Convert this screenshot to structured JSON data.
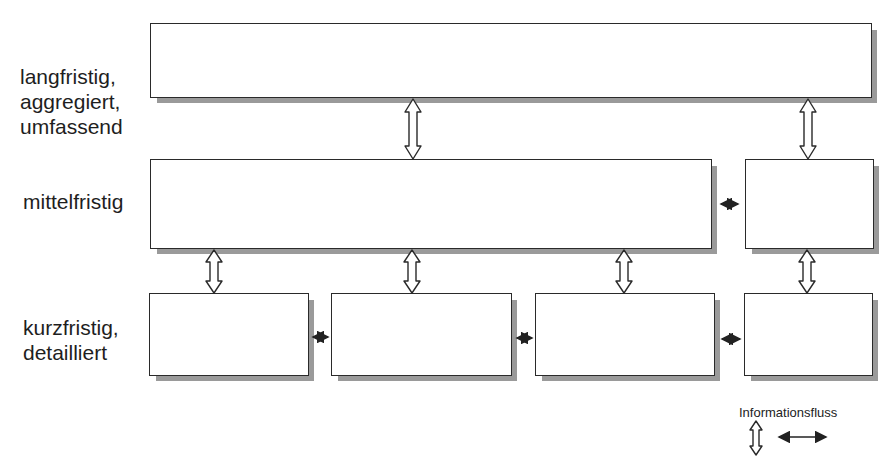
{
  "levels": [
    {
      "lines": [
        "langfristig,",
        "aggregiert,",
        "umfassend"
      ]
    },
    {
      "lines": [
        "mittelfristig"
      ]
    },
    {
      "lines": [
        "kurzfristig,",
        "detailliert"
      ]
    }
  ],
  "legend": {
    "title": "Informationsfluss",
    "items": [
      "vertical-double-arrow",
      "horizontal-double-arrow"
    ]
  },
  "boxes": {
    "top": 1,
    "middle": 2,
    "bottom": 4
  }
}
